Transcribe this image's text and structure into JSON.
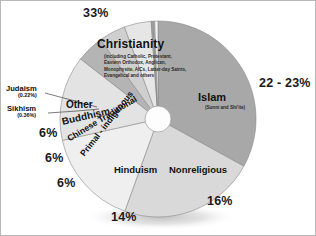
{
  "chart_data": {
    "type": "pie",
    "title": "",
    "legend_position": "none",
    "grid": false,
    "center": {
      "x": 157,
      "y": 118
    },
    "radius": 98,
    "inner_radius": 13,
    "categories": [
      "Christianity",
      "Islam",
      "Nonreligious",
      "Hinduism",
      "Primal - indigenous",
      "Chinese Traditional",
      "Buddhism",
      "Sikhism",
      "Judaism",
      "Other"
    ],
    "values": [
      33,
      22.5,
      16,
      14,
      6,
      6,
      6,
      0.36,
      0.22,
      1.0
    ],
    "value_labels": [
      "33%",
      "22 - 23%",
      "16%",
      "14%",
      "6%",
      "6%",
      "6%",
      "0.36%",
      "0.22%",
      ""
    ],
    "slice_colors": [
      "#a8a8a8",
      "#d9d9d9",
      "#efefef",
      "#e3e3e3",
      "#b4b4b4",
      "#cfcfcf",
      "#e6e6e6",
      "#9e9e9e",
      "#bcbcbc",
      "#f4f4f4"
    ],
    "slice_start_angles": [
      0,
      118.8,
      199.8,
      257.4,
      307.8,
      324.0,
      340.0,
      356.0,
      357.3,
      358.1
    ],
    "slice_end_angles": [
      118.8,
      199.8,
      257.4,
      307.8,
      324.0,
      340.0,
      356.0,
      357.3,
      358.1,
      360.0
    ]
  },
  "labels": {
    "christianity": "Christianity",
    "christianity_detail": "(including Catholic, Protestant, Eastern Orthodox, Anglican, Monophysite, AICs, Latter-day Saints, Evangelical and others",
    "islam": "Islam",
    "islam_detail": "(Sunni and Shi'ite)",
    "nonreligious": "Nonreligious",
    "hinduism": "Hinduism",
    "other": "Other",
    "buddhism": "Buddhism",
    "chinese_traditional": "Chinese Traditional",
    "primal_indigenous": "Primal - indigenous",
    "judaism": "Judaism",
    "judaism_pct": "(0.22%)",
    "sikhism": "Sikhism",
    "sikhism_pct": "(0.36%)"
  },
  "percents": {
    "christianity": "33%",
    "islam": "22 - 23%",
    "nonreligious": "16%",
    "hinduism": "14%",
    "primal": "6%",
    "chinese": "6%",
    "buddhism": "6%"
  },
  "colors": {
    "background": "#ffffff",
    "frame": "#b8b8b8",
    "text": "#111111",
    "slice_edge": "#8a8a8a",
    "shadow": "#c9c9c9"
  }
}
